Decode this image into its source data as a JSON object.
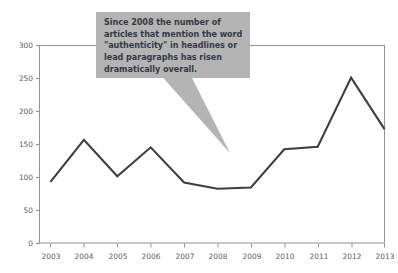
{
  "chart_data": {
    "type": "line",
    "title": "",
    "subtitle": "",
    "xlabel": "",
    "ylabel": "",
    "categories": [
      "2003",
      "2004",
      "2005",
      "2006",
      "2007",
      "2008",
      "2009",
      "2010",
      "2011",
      "2012",
      "2013"
    ],
    "values": [
      98,
      165,
      107,
      153,
      97,
      87,
      89,
      150,
      154,
      264,
      182
    ],
    "series": [
      {
        "name": "Articles mentioning \"authenticity\"",
        "values": [
          98,
          165,
          107,
          153,
          97,
          87,
          89,
          150,
          154,
          264,
          182
        ]
      }
    ],
    "ylim": [
      0,
      315
    ],
    "xlim": [
      "2003",
      "2013"
    ],
    "y_ticks": [
      0,
      50,
      100,
      150,
      200,
      250,
      300
    ],
    "y_tick_labels": [
      "0",
      "50",
      "100",
      "150",
      "200",
      "250",
      "300"
    ],
    "x_ticks": [
      "2003",
      "2004",
      "2005",
      "2006",
      "2007",
      "2008",
      "2009",
      "2010",
      "2011",
      "2012",
      "2013"
    ],
    "grid": false,
    "legend": false,
    "legend_position": "none",
    "line_color": "#3a3f4a",
    "line_width": 2.1,
    "frame_color": "#8f939a",
    "background_color": "#ffffff",
    "annotations": [
      {
        "id": "authenticity-callout",
        "text": "Since  2008 the number of\narticles that mention the word\n\"authenticity\" in headlines or\nlead paragraphs has risen\ndramatically overall.",
        "points_to": "2009",
        "background_color": "#b4b4b4",
        "text_color": "#343a46"
      }
    ]
  },
  "callout": {
    "text": "Since  2008 the number of\narticles that mention the word\n\"authenticity\" in headlines or\nlead paragraphs has risen\ndramatically overall."
  },
  "axes": {
    "y_tick_labels": [
      "300",
      "250",
      "200",
      "150",
      "100",
      "50",
      "0"
    ],
    "x_tick_labels": [
      "2003",
      "2004",
      "2005",
      "2006",
      "2007",
      "2008",
      "2009",
      "2010",
      "2011",
      "2012",
      "2013"
    ]
  }
}
